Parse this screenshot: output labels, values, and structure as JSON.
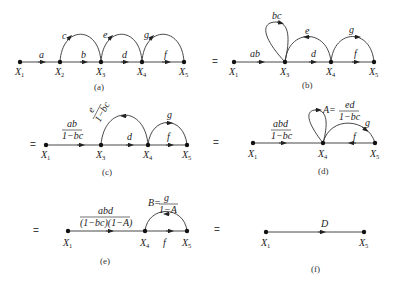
{
  "figure": {
    "panels": [
      {
        "id": "a",
        "caption": "(a)",
        "prefix": "",
        "nodes": [
          "X1",
          "X2",
          "X3",
          "X4",
          "X5"
        ],
        "forward_edges": [
          {
            "from": "X1",
            "to": "X2",
            "label": "a"
          },
          {
            "from": "X2",
            "to": "X3",
            "label": "b"
          },
          {
            "from": "X3",
            "to": "X4",
            "label": "d"
          },
          {
            "from": "X4",
            "to": "X5",
            "label": "f"
          }
        ],
        "arcs": [
          {
            "from": "X3",
            "to": "X2",
            "label": "c"
          },
          {
            "from": "X4",
            "to": "X3",
            "label": "e"
          },
          {
            "from": "X5",
            "to": "X4",
            "label": "g"
          }
        ]
      },
      {
        "id": "b",
        "caption": "(b)",
        "prefix": "=",
        "nodes": [
          "X1",
          "X3",
          "X4",
          "X5"
        ],
        "forward_edges": [
          {
            "from": "X1",
            "to": "X3",
            "label": "ab"
          },
          {
            "from": "X3",
            "to": "X4",
            "label": "d"
          },
          {
            "from": "X4",
            "to": "X5",
            "label": "f"
          }
        ],
        "self_loops": [
          {
            "node": "X3",
            "label": "bc"
          }
        ],
        "arcs": [
          {
            "from": "X4",
            "to": "X3",
            "label": "e"
          },
          {
            "from": "X5",
            "to": "X4",
            "label": "g"
          }
        ]
      },
      {
        "id": "c",
        "caption": "(c)",
        "prefix": "=",
        "nodes": [
          "X1",
          "X3",
          "X4",
          "X5"
        ],
        "forward_edges": [
          {
            "from": "X1",
            "to": "X3",
            "label_num": "ab",
            "label_den": "1−bc"
          },
          {
            "from": "X3",
            "to": "X4",
            "label": "d"
          },
          {
            "from": "X4",
            "to": "X5",
            "label": "f"
          }
        ],
        "arcs": [
          {
            "from": "X4",
            "to": "X3",
            "label_num": "e",
            "label_den": "1−bc"
          },
          {
            "from": "X5",
            "to": "X4",
            "label": "g"
          }
        ]
      },
      {
        "id": "d",
        "caption": "(d)",
        "prefix": "=",
        "nodes": [
          "X1",
          "X4",
          "X5"
        ],
        "forward_edges": [
          {
            "from": "X1",
            "to": "X4",
            "label_num": "abd",
            "label_den": "1−bc"
          },
          {
            "from": "X4",
            "to": "X5",
            "label": "f"
          }
        ],
        "self_loops": [
          {
            "node": "X4",
            "label_prefix": "A=",
            "label_num": "ed",
            "label_den": "1−bc"
          }
        ],
        "arcs": [
          {
            "from": "X5",
            "to": "X4",
            "label": "g"
          }
        ]
      },
      {
        "id": "e",
        "caption": "(e)",
        "prefix": "=",
        "nodes": [
          "X1",
          "X4",
          "X5"
        ],
        "forward_edges": [
          {
            "from": "X1",
            "to": "X4",
            "label_num": "abd",
            "label_den": "(1−bc)(1−A)"
          },
          {
            "from": "X4",
            "to": "X5",
            "label": "f"
          }
        ],
        "arcs": [
          {
            "from": "X5",
            "to": "X4",
            "label_prefix": "B=",
            "label_num": "g",
            "label_den": "1−A"
          }
        ]
      },
      {
        "id": "f",
        "caption": "(f)",
        "prefix": "=",
        "nodes": [
          "X1",
          "X5"
        ],
        "forward_edges": [
          {
            "from": "X1",
            "to": "X5",
            "label": "D"
          }
        ]
      }
    ]
  },
  "text": {
    "X": "X",
    "n1": "1",
    "n2": "2",
    "n3": "3",
    "n4": "4",
    "n5": "5",
    "eq": "=",
    "a": "a",
    "b": "b",
    "c": "c",
    "d": "d",
    "e": "e",
    "f": "f",
    "g": "g",
    "ab": "ab",
    "bc": "bc",
    "ab_over": "ab",
    "one_minus_bc": "1−bc",
    "e_over": "e",
    "abd": "abd",
    "A_eq": "A=",
    "ed": "ed",
    "B_eq": "B=",
    "g_over": "g",
    "one_minus_A": "1−A",
    "den_e": "(1−bc)(1−A)",
    "D": "D",
    "cap_a": "(a)",
    "cap_b": "(b)",
    "cap_c": "(c)",
    "cap_d": "(d)",
    "cap_e": "(e)",
    "cap_f": "(f)"
  }
}
